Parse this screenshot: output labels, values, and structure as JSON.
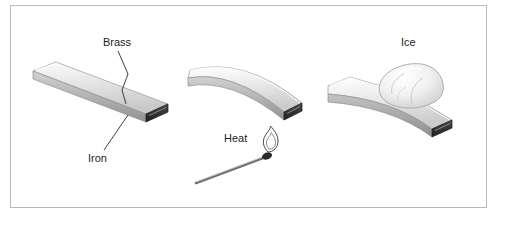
{
  "figure": {
    "background_color": "#ffffff",
    "frame_border_color": "#b9b9b9",
    "panels": [
      {
        "name": "room-temperature",
        "state": "straight",
        "labels": [
          "Brass",
          "Iron"
        ]
      },
      {
        "name": "heated",
        "state": "curved-up",
        "labels": [
          "Heat"
        ]
      },
      {
        "name": "cooled",
        "state": "curved-down",
        "labels": [
          "Ice"
        ]
      }
    ],
    "labels": {
      "brass": "Brass",
      "iron": "Iron",
      "heat": "Heat",
      "ice": "Ice"
    },
    "colors": {
      "strip_top_light": "#f2f2f2",
      "strip_top_mid": "#d6d6d6",
      "strip_side": "#a8a8a8",
      "strip_end_dark": "#3a3a3a",
      "ice_light": "#fbfbfb",
      "ice_shade": "#cfcfcf",
      "match_stick": "#6d6d6d",
      "match_head": "#2b2b2b",
      "flame_outline": "#4a4a4a",
      "leader_line": "#2a2a2a",
      "label_text": "#1d1d1d"
    }
  }
}
